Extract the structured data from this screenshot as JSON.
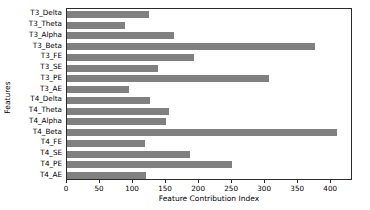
{
  "chart_data": {
    "type": "bar",
    "orientation": "horizontal",
    "title": "",
    "xlabel": "Feature Contribution Index",
    "ylabel": "Features",
    "xlim": [
      0,
      433
    ],
    "xticks": [
      0,
      50,
      100,
      150,
      200,
      250,
      300,
      350,
      400
    ],
    "grid": false,
    "legend": null,
    "bar_color": "#808080",
    "axes_color": "#2b2b2b",
    "categories": [
      "T3_Delta",
      "T3_Theta",
      "T3_Alpha",
      "T3_Beta",
      "T3_FE",
      "T3_SE",
      "T3_PE",
      "T3_AE",
      "T4_Delta",
      "T4_Theta",
      "T4_Alpha",
      "T4_Beta",
      "T4_FE",
      "T4_SE",
      "T4_PE",
      "T4_AE"
    ],
    "values": [
      124,
      88,
      162,
      376,
      192,
      138,
      306,
      94,
      126,
      154,
      150,
      409,
      118,
      186,
      250,
      120
    ]
  }
}
